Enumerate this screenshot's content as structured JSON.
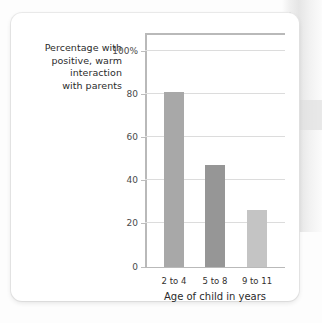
{
  "figure": {
    "y_axis_caption": [
      "Percentage with",
      "positive, warm",
      "interaction",
      "with parents"
    ],
    "x_axis_title": "Age of child in years"
  },
  "chart_data": {
    "type": "bar",
    "title": "",
    "subtitle": "",
    "categories": [
      "2 to 4",
      "5 to 8",
      "9 to 11"
    ],
    "values": [
      81,
      47,
      26
    ],
    "xlabel": "Age of child in years",
    "ylabel": "Percentage with positive, warm interaction with parents",
    "ylim": [
      0,
      100
    ],
    "yticks": [
      0,
      20,
      40,
      60,
      80,
      100
    ],
    "ytick_labels": [
      "0",
      "20",
      "40",
      "60",
      "80",
      "100%"
    ],
    "grid": "horizontal",
    "legend": "none",
    "bar_colors": [
      "#a8a8a8",
      "#969696",
      "#c4c4c4"
    ]
  }
}
